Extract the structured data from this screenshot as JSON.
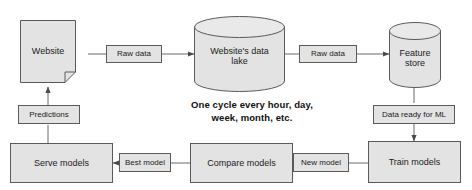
{
  "diagram": {
    "caption": "One cycle every hour, day,\nweek, month, etc.",
    "colors": {
      "node_fill": "#e3e3e3",
      "node_stroke": "#5a5a5a",
      "edge_stroke": "#6a6a6a",
      "text": "#1b1b1b",
      "background": "#ffffff"
    },
    "nodes": [
      {
        "id": "website",
        "label": "Website",
        "shape": "document"
      },
      {
        "id": "data_lake",
        "label": "Website's data\nlake",
        "shape": "cylinder"
      },
      {
        "id": "feature_store",
        "label": "Feature\nstore",
        "shape": "cylinder"
      },
      {
        "id": "train_models",
        "label": "Train models",
        "shape": "rectangle"
      },
      {
        "id": "compare_models",
        "label": "Compare models",
        "shape": "rectangle"
      },
      {
        "id": "serve_models",
        "label": "Serve models",
        "shape": "rectangle"
      }
    ],
    "edge_labels": [
      {
        "id": "raw_data_1",
        "label": "Raw data"
      },
      {
        "id": "raw_data_2",
        "label": "Raw data"
      },
      {
        "id": "data_ready",
        "label": "Data ready for ML"
      },
      {
        "id": "new_model",
        "label": "New model"
      },
      {
        "id": "best_model",
        "label": "Best model"
      },
      {
        "id": "predictions",
        "label": "Predictions"
      }
    ],
    "edges": [
      {
        "from": "website",
        "to": "data_lake",
        "label": "Raw data",
        "direction": "right"
      },
      {
        "from": "data_lake",
        "to": "feature_store",
        "label": "Raw data",
        "direction": "right"
      },
      {
        "from": "feature_store",
        "to": "train_models",
        "label": "Data ready for ML",
        "direction": "down"
      },
      {
        "from": "train_models",
        "to": "compare_models",
        "label": "New model",
        "direction": "left"
      },
      {
        "from": "compare_models",
        "to": "serve_models",
        "label": "Best model",
        "direction": "left"
      },
      {
        "from": "serve_models",
        "to": "website",
        "label": "Predictions",
        "direction": "up"
      }
    ]
  }
}
